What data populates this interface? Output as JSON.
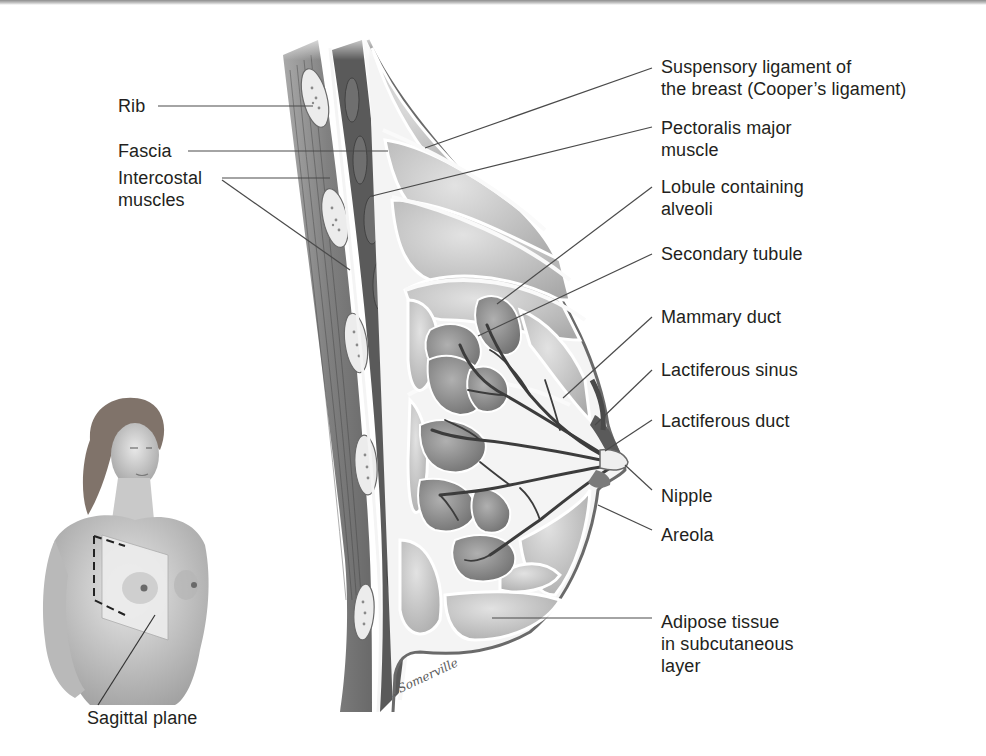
{
  "figure": {
    "colors": {
      "background": "#ffffff",
      "text": "#231f20",
      "leader_line": "#4a4a4a",
      "muscle": "#5f5f5f",
      "adipose": "#c4c4c4",
      "lobule": "#8a8a8a",
      "duct": "#3c3c3c",
      "skin": "#d8d8d8"
    }
  },
  "labels_left": [
    {
      "id": "rib",
      "text": "Rib"
    },
    {
      "id": "fascia",
      "text": "Fascia"
    },
    {
      "id": "intercostal-muscles",
      "text": "Intercostal\nmuscles"
    }
  ],
  "labels_right": [
    {
      "id": "suspensory-ligament",
      "text": "Suspensory ligament of\nthe breast (Cooper’s ligament)"
    },
    {
      "id": "pectoralis-major",
      "text": "Pectoralis major\nmuscle"
    },
    {
      "id": "lobule",
      "text": "Lobule containing\nalveoli"
    },
    {
      "id": "secondary-tubule",
      "text": "Secondary tubule"
    },
    {
      "id": "mammary-duct",
      "text": "Mammary duct"
    },
    {
      "id": "lactiferous-sinus",
      "text": "Lactiferous sinus"
    },
    {
      "id": "lactiferous-duct",
      "text": "Lactiferous duct"
    },
    {
      "id": "nipple",
      "text": "Nipple"
    },
    {
      "id": "areola",
      "text": "Areola"
    },
    {
      "id": "adipose-tissue",
      "text": "Adipose tissue\nin subcutaneous\nlayer"
    }
  ],
  "inset": {
    "label": "Sagittal plane"
  },
  "signature": "K. Somerville"
}
